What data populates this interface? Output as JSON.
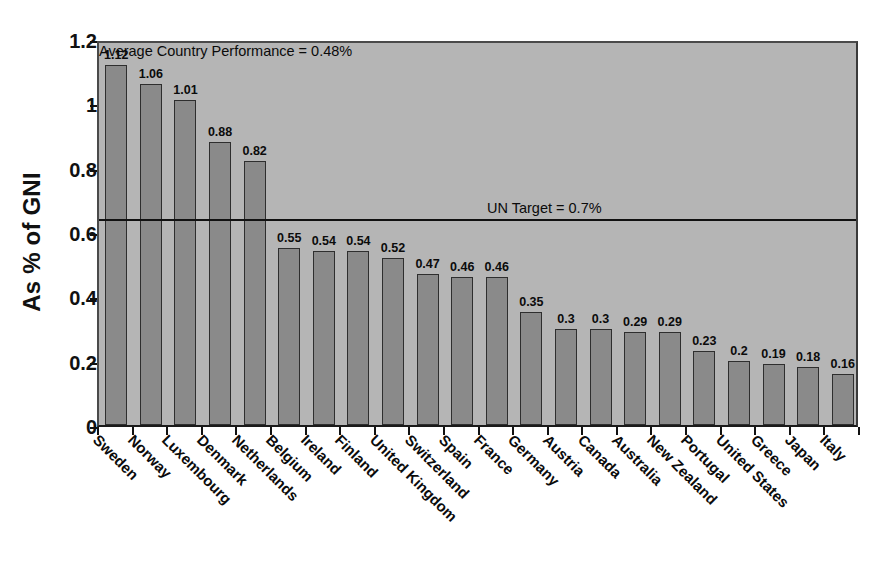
{
  "chart_data": {
    "type": "bar",
    "title": "",
    "xlabel": "",
    "ylabel": "As % of GNI",
    "ylim": [
      0,
      1.2
    ],
    "ytick_labels": [
      "0",
      "0.2",
      "0.4",
      "0.6",
      "0.8",
      "1",
      "1.2"
    ],
    "ytick_values": [
      0,
      0.2,
      0.4,
      0.6,
      0.8,
      1,
      1.2
    ],
    "grid": false,
    "legend": "none",
    "categories": [
      "Sweden",
      "Norway",
      "Luxembourg",
      "Denmark",
      "Netherlands",
      "Belgium",
      "Ireland",
      "Finland",
      "United Kingdom",
      "Switzerland",
      "Spain",
      "France",
      "Germany",
      "Austria",
      "Canada",
      "Australia",
      "New Zealand",
      "Portugal",
      "United States",
      "Greece",
      "Japan",
      "Italy"
    ],
    "values": [
      1.12,
      1.06,
      1.01,
      0.88,
      0.82,
      0.55,
      0.54,
      0.54,
      0.52,
      0.47,
      0.46,
      0.46,
      0.35,
      0.3,
      0.3,
      0.29,
      0.29,
      0.23,
      0.2,
      0.19,
      0.18,
      0.16
    ],
    "value_labels": [
      "1.12",
      "1.06",
      "1.01",
      "0.88",
      "0.82",
      "0.55",
      "0.54",
      "0.54",
      "0.52",
      "0.47",
      "0.46",
      "0.46",
      "0.35",
      "0.3",
      "0.3",
      "0.29",
      "0.29",
      "0.23",
      "0.2",
      "0.19",
      "0.18",
      "0.16"
    ],
    "reference_lines": [
      {
        "name": "un-target",
        "label": "UN Target = 0.7%",
        "value": 0.7,
        "plot_position": 0.635,
        "style": "solid"
      },
      {
        "name": "average-country-performance",
        "label": "Average Country Performance  = 0.48%",
        "value": 0.48,
        "plot_position": 0.49,
        "style": "dashed"
      }
    ],
    "colors": {
      "bar_fill": "#8a8a8a",
      "bar_border": "#2e2e2e",
      "plot_background": "#b5b5b5",
      "page_background": "#ffffff",
      "axis": "#111111",
      "reference_line": "#111111",
      "text": "#0b0b0b"
    }
  }
}
